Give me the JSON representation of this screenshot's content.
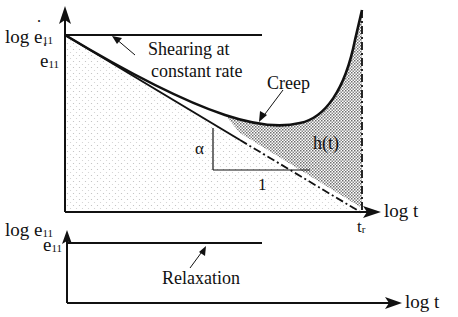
{
  "figure": {
    "top_panel": {
      "y_axis_label": {
        "prefix": "log ",
        "symbol": "e",
        "subscript": "11",
        "dotted": true
      },
      "y_tick_label": {
        "symbol": "e",
        "subscript": "11",
        "dotted": true
      },
      "x_axis_label": "log t",
      "x_tick_label": {
        "symbol": "t",
        "subscript": "r"
      },
      "annotations": {
        "shearing_line1": "Shearing at",
        "shearing_line2": "constant rate",
        "creep": "Creep",
        "hatched_region": "h(t)",
        "slope_vertical": "α",
        "slope_horizontal": "1"
      }
    },
    "bottom_panel": {
      "y_axis_label": {
        "prefix": "log ",
        "symbol": "e",
        "subscript": "11",
        "dotted": false
      },
      "y_tick_label": {
        "symbol": "e",
        "subscript": "11",
        "dotted": false
      },
      "x_axis_label": "log t",
      "annotations": {
        "relaxation": "Relaxation"
      }
    }
  },
  "colors": {
    "ink": "#111111",
    "shade_light": "#d9d9d9",
    "shade_dark": "#8a8a8a"
  }
}
